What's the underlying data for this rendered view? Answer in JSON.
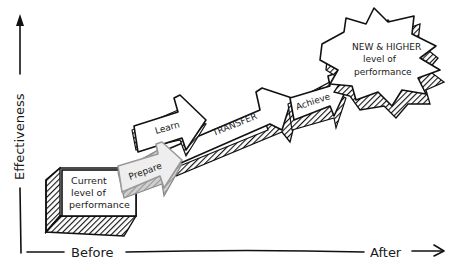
{
  "diagram": {
    "axes": {
      "y_label": "Effectiveness",
      "x_label_start": "Before",
      "x_label_end": "After"
    },
    "start_box": {
      "line1": "Current",
      "line2": "level of",
      "line3": "performance"
    },
    "steps": [
      {
        "label": "Prepare"
      },
      {
        "label": "Learn"
      },
      {
        "label": "TRANSFER"
      },
      {
        "label": "Achieve"
      }
    ],
    "goal_burst": {
      "line1": "NEW & HIGHER",
      "line2": "level of",
      "line3": "performance"
    },
    "colors": {
      "ink": "#111111",
      "paper": "#ffffff",
      "prepare_fill": "#e6e6e6",
      "shadow": "#3a3a3a"
    }
  }
}
